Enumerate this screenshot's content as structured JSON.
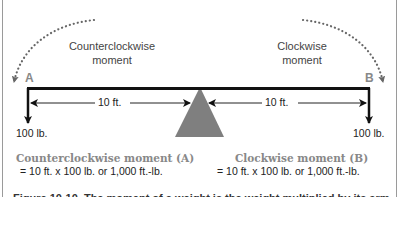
{
  "diagram": {
    "labels": {
      "counterclockwise": "Counterclockwise\nmoment",
      "counterclockwise_line1": "Counterclockwise",
      "counterclockwise_line2": "moment",
      "clockwise_line1": "Clockwise",
      "clockwise_line2": "moment",
      "point_a": "A",
      "point_b": "B"
    },
    "weights": {
      "left": "100 lb.",
      "right": "100 lb."
    },
    "distances": {
      "left": "10 ft.",
      "right": "10 ft."
    },
    "moments": {
      "left_title": "Counterclockwise moment (A)",
      "left_calc": "= 10 ft. x 100 lb. or 1,000 ft.-lb.",
      "right_title": "Clockwise moment (B)",
      "right_calc": "= 10 ft. x 100 lb. or 1,000 ft.-lb."
    },
    "caption": "Figure 10-10. The moment of a weight is the weight multiplied by its arm.",
    "colors": {
      "fulcrum": "#7f7f7f",
      "beam": "#111111",
      "label_gray": "#888888",
      "frame": "#9a9a9a"
    }
  }
}
